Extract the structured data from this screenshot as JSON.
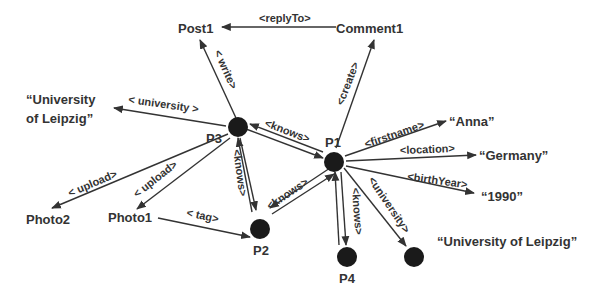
{
  "diagram": {
    "type": "rdf-graph",
    "nodes": {
      "post1": "Post1",
      "comment1": "Comment1",
      "p1": "P1",
      "p2": "P2",
      "p3": "P3",
      "p4": "P4",
      "uni_literal_left": [
        "“University",
        "of Leipzig”"
      ],
      "uni_literal_right": "“University of Leipzig”",
      "photo1": "Photo1",
      "photo2": "Photo2",
      "anna": "“Anna”",
      "germany": "“Germany”",
      "year": "“1990”"
    },
    "edges": {
      "replyTo": "<replyTo>",
      "write": "< write>",
      "create": "<create>",
      "university_p3": "< university >",
      "knows_p3_p1": "<knows>",
      "knows_p3_p2": "<knows>",
      "knows_p2_p1": "<knows>",
      "knows_p1_p4": "<knows>",
      "upload_photo2": "< upload>",
      "upload_photo1": "< upload>",
      "tag": "< tag>",
      "firstname": "<firstname>",
      "location": "<location>",
      "birthYear": "<birthYear>",
      "university_p1": "<university>"
    }
  }
}
